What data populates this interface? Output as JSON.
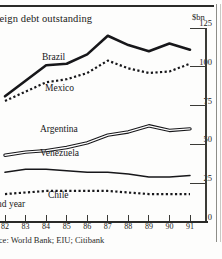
{
  "figure": {
    "title": "reign debt outstanding",
    "unit_label": "$bn",
    "xaxis_caption": "nd year",
    "source": "rce: World Bank; EIU; Citibank"
  },
  "chart_data": {
    "type": "line",
    "title": "reign debt outstanding",
    "xlabel": "nd year",
    "ylabel": "$bn",
    "ylim": [
      0,
      125
    ],
    "yticks": [
      125,
      100,
      75,
      50,
      25,
      0
    ],
    "ytick_labels": [
      "125",
      "100",
      "75",
      "50",
      "25",
      "0"
    ],
    "grid": false,
    "legend": "inline-labels",
    "x": [
      82,
      83,
      84,
      85,
      86,
      87,
      88,
      89,
      90,
      91
    ],
    "xtick_labels": [
      "82",
      "83",
      "84",
      "85",
      "86",
      "87",
      "88",
      "89",
      "90",
      "91"
    ],
    "series": [
      {
        "name": "Brazil",
        "style": "thick-solid",
        "color": "#17171a",
        "values": [
          81,
          91,
          101,
          102,
          108,
          120,
          114,
          110,
          115,
          111
        ],
        "label_x": 42,
        "label_y": 52
      },
      {
        "name": "Mexico",
        "style": "dotted",
        "color": "#17171a",
        "values": [
          78,
          84,
          90,
          92,
          96,
          104,
          99,
          96,
          97,
          102
        ],
        "label_x": 45,
        "label_y": 83
      },
      {
        "name": "Argentina",
        "style": "double-line",
        "color": "#17171a",
        "values": [
          43,
          45,
          46,
          48,
          51,
          56,
          58,
          62,
          59,
          60
        ],
        "label_x": 40,
        "label_y": 124
      },
      {
        "name": "Venezuela",
        "style": "thin-solid",
        "color": "#17171a",
        "values": [
          32,
          34,
          34,
          33,
          32,
          32,
          31,
          29,
          29,
          30
        ],
        "label_x": 40,
        "label_y": 148
      },
      {
        "name": "Chile",
        "style": "dotted",
        "color": "#17171a",
        "values": [
          18,
          19,
          20,
          20,
          20,
          20,
          19,
          18,
          18,
          18
        ],
        "label_x": 48,
        "label_y": 190
      }
    ]
  }
}
